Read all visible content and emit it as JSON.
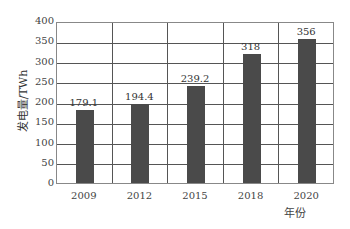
{
  "chart_data": {
    "type": "bar",
    "title": "",
    "xlabel": "年份",
    "ylabel": "发电量/TWh",
    "categories": [
      "2009",
      "2012",
      "2015",
      "2018",
      "2020"
    ],
    "values": [
      179.1,
      194.4,
      239.2,
      318,
      356
    ],
    "value_labels": [
      "179.1",
      "194.4",
      "239.2",
      "318",
      "356"
    ],
    "ylim": [
      0,
      400
    ],
    "yticks": [
      "0",
      "50",
      "100",
      "150",
      "200",
      "250",
      "300",
      "350",
      "400"
    ],
    "grid": true,
    "bar_color": "#4a4a4a",
    "legend": null
  }
}
